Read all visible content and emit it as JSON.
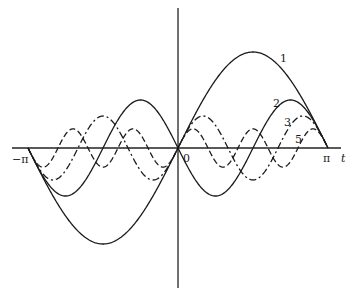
{
  "chart_data": {
    "type": "line",
    "title": "",
    "xlabel": "t",
    "ylabel": "",
    "xlim": [
      -3.14159,
      3.14159
    ],
    "x_tick_labels": [
      "−π",
      "0",
      "π"
    ],
    "grid": false,
    "legend": "inline curve labels",
    "formula": "f_n(t) = 2(-1)^(n+1) sin(n t) / n",
    "series": [
      {
        "name": "1",
        "n": 1,
        "amplitude": 2.0,
        "style": "solid",
        "peak": {
          "t": 1.571,
          "y": 2.0
        }
      },
      {
        "name": "2",
        "n": 2,
        "amplitude": 1.0,
        "style": "solid",
        "peak": {
          "t": 2.356,
          "y": 1.0
        }
      },
      {
        "name": "3",
        "n": 3,
        "amplitude": 0.667,
        "style": "dash-dot",
        "peak": {
          "t": 2.618,
          "y": 0.667
        }
      },
      {
        "name": "5",
        "n": 5,
        "amplitude": 0.4,
        "style": "dashed",
        "peak": {
          "t": 2.827,
          "y": 0.4
        }
      }
    ]
  },
  "axes": {
    "x_label": "t",
    "origin_label": "0",
    "neg_pi_label": "−π",
    "pi_label": "π"
  },
  "curve_labels": {
    "c1": "1",
    "c2": "2",
    "c3": "3",
    "c5": "5"
  }
}
